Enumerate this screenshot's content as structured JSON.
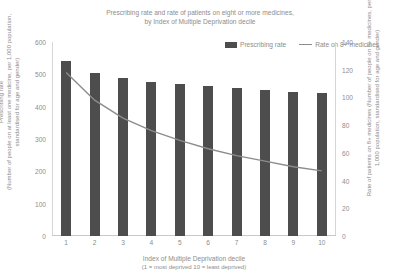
{
  "chart_data": {
    "type": "bar",
    "title": "Prescribing rate and rate of patients on eight or more medicines, by Index of Multiple Deprivation decile",
    "title_line1": "Prescribing rate and rate of patients on eight or more medicines,",
    "title_line2": "by Index of Multiple Deprivation decile",
    "categories": [
      "1",
      "2",
      "3",
      "4",
      "5",
      "6",
      "7",
      "8",
      "9",
      "10"
    ],
    "xlabel": "Index of Multiple Deprivation decile",
    "xlabel_sub": "(1 = most deprived 10 = least deprived)",
    "grid": false,
    "legend_position": "top-right",
    "series": [
      {
        "name": "Prescribing rate",
        "type": "bar",
        "axis": "left",
        "color": "#4d4d4d",
        "values": [
          540,
          505,
          488,
          477,
          470,
          464,
          458,
          452,
          446,
          442
        ]
      },
      {
        "name": "Rate on 8+ medicines",
        "type": "line",
        "axis": "right",
        "color": "#8c8c8c",
        "values": [
          118,
          98,
          85,
          76,
          69,
          63,
          58,
          54,
          50,
          47
        ]
      }
    ],
    "yaxis_left": {
      "title_line1": "Prescribing rate",
      "title_line2": "(Number of people on at least one medicine, per 1,000 population, standardised for age and gender)",
      "min": 0,
      "max": 600,
      "step": 100,
      "ticks": [
        "600",
        "500",
        "400",
        "300",
        "200",
        "100",
        "0"
      ]
    },
    "yaxis_right": {
      "title_line1": "Rate of patients on 8+ medicines",
      "title_line2": "(Number of people on 8+ medicines, per 1,000 population, standardised for age and gender)",
      "min": 0,
      "max": 140,
      "step": 20,
      "ticks": [
        "140",
        "120",
        "100",
        "80",
        "60",
        "40",
        "20",
        "0"
      ]
    },
    "legend": [
      {
        "label": "Prescribing rate",
        "marker": "bar-swatch",
        "color": "#4d4d4d"
      },
      {
        "label": "Rate on 8+ medicines",
        "marker": "line-swatch",
        "color": "#8c8c8c"
      }
    ]
  }
}
